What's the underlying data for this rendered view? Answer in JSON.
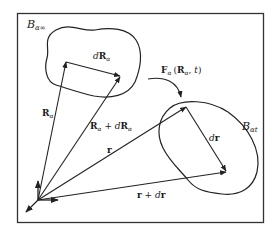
{
  "figure": {
    "type": "continuum-mechanics-deformation-diagram",
    "stroke_color": "#222222",
    "background": "#ffffff",
    "frame": {
      "x": 17,
      "y": 13,
      "width": 247,
      "height": 210
    },
    "regions": {
      "reference": {
        "label_main": "B",
        "label_sub": "α∞"
      },
      "current": {
        "label_main": "B",
        "label_sub": "αt"
      }
    },
    "vectors": {
      "R": {
        "main": "R",
        "sub": "α"
      },
      "R_plus_dR": {
        "main1": "R",
        "sub1": "α",
        "op": " + ",
        "d": "d",
        "main2": "R",
        "sub2": "α"
      },
      "dR": {
        "d": "d",
        "main": "R",
        "sub": "α"
      },
      "r": {
        "main": "r"
      },
      "r_plus_dr": {
        "main1": "r",
        "op": " + ",
        "d": "d",
        "main2": "r"
      },
      "dr": {
        "d": "d",
        "main": "r"
      }
    },
    "mapping": {
      "label_main": "F",
      "label_sub": "α",
      "label_args_open": "(",
      "label_arg1_main": "R",
      "label_arg1_sub": "α",
      "label_sep": ", ",
      "label_arg2": "t",
      "label_args_close": ")"
    }
  }
}
